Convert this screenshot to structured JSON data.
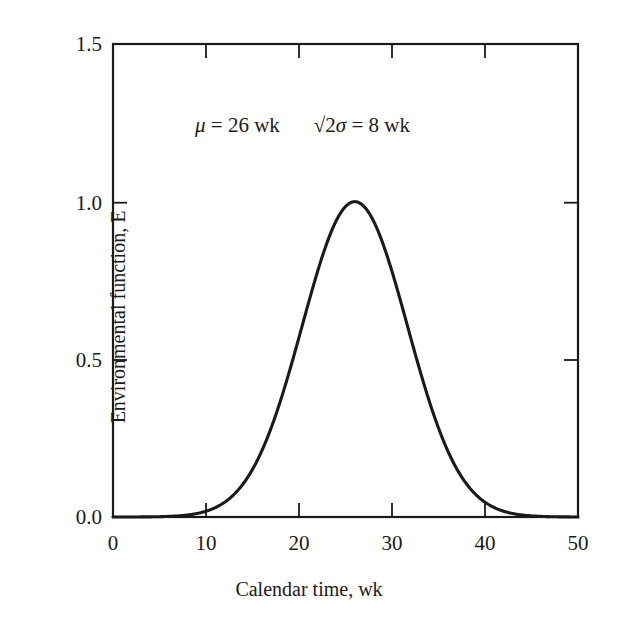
{
  "chart_data": {
    "type": "line",
    "title": "",
    "subtitle": "",
    "xlabel": "Calendar time, wk",
    "ylabel": "Environmental function, E",
    "xlim": [
      0,
      50
    ],
    "ylim": [
      0,
      1.5
    ],
    "xticks": [
      "0",
      "10",
      "20",
      "30",
      "40",
      "50"
    ],
    "xtick_values": [
      0,
      10,
      20,
      30,
      40,
      50
    ],
    "yticks": [
      "0.0",
      "0.5",
      "1.0",
      "1.5"
    ],
    "ytick_values": [
      0.0,
      0.5,
      1.0,
      1.5
    ],
    "grid": false,
    "legend": "none",
    "annotations": [
      {
        "text": "μ = 26 wk",
        "mu_symbol": "μ",
        "equals": "=",
        "value": "26",
        "unit": "wk"
      },
      {
        "text": "√2σ = 8 wk",
        "radical": "√",
        "sigma_expr": "2σ",
        "equals": "=",
        "value": "8",
        "unit": "wk"
      }
    ],
    "series": [
      {
        "name": "Environmental function E",
        "formula": "E = exp(-((t - 26) / 8)^2)",
        "mu": 26,
        "sqrt2sigma": 8,
        "peak_x": 26,
        "peak_y": 1.0,
        "x": [
          0,
          2,
          4,
          6,
          8,
          10,
          11,
          12,
          13,
          14,
          15,
          16,
          17,
          18,
          19,
          20,
          21,
          22,
          23,
          24,
          25,
          26,
          27,
          28,
          29,
          30,
          31,
          32,
          33,
          34,
          35,
          36,
          37,
          38,
          39,
          40,
          41,
          42,
          44,
          46,
          48,
          50
        ],
        "values": [
          0.0,
          0.001,
          0.003,
          0.007,
          0.018,
          0.042,
          0.063,
          0.09,
          0.125,
          0.169,
          0.222,
          0.285,
          0.355,
          0.431,
          0.51,
          0.59,
          0.667,
          0.736,
          0.795,
          0.841,
          0.874,
          0.891,
          0.874,
          0.841,
          0.795,
          0.736,
          0.667,
          0.59,
          0.51,
          0.431,
          0.355,
          0.285,
          0.222,
          0.169,
          0.125,
          0.09,
          0.063,
          0.042,
          0.018,
          0.007,
          0.002,
          0.0
        ],
        "color": "#1a1a1a",
        "style": "solid"
      }
    ]
  },
  "axis": {
    "y_title": "Environmental function, E",
    "x_title": "Calendar time, wk",
    "y_tick_labels": [
      "1.5",
      "1.0",
      "0.5",
      "0.0"
    ],
    "x_tick_labels": [
      "0",
      "10",
      "20",
      "30",
      "40",
      "50"
    ]
  },
  "annotation": {
    "mu_symbol": "μ",
    "mu_rest": " = 26 wk",
    "sqrt_symbol": "√",
    "sqrt_two": "2",
    "sigma_symbol": "σ",
    "sigma_rest": " = 8 wk"
  },
  "colors": {
    "curve": "#1a1a1a",
    "axis": "#1a1a1a",
    "background": "#ffffff"
  }
}
